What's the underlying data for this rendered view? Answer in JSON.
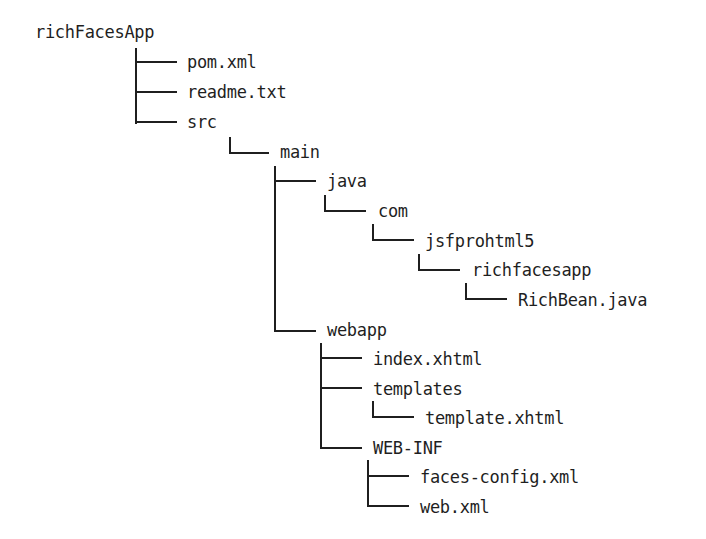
{
  "diagram": {
    "type": "directory-tree",
    "line_color": "#1f1f1f",
    "text_color": "#1f1f1f",
    "background": "#ffffff",
    "nodes": [
      {
        "id": "root",
        "label": "richFacesApp",
        "depth": 0,
        "kind": "folder"
      },
      {
        "id": "pom",
        "label": "pom.xml",
        "depth": 1,
        "kind": "file",
        "parent": "root"
      },
      {
        "id": "readme",
        "label": "readme.txt",
        "depth": 1,
        "kind": "file",
        "parent": "root"
      },
      {
        "id": "src",
        "label": "src",
        "depth": 1,
        "kind": "folder",
        "parent": "root"
      },
      {
        "id": "main",
        "label": "main",
        "depth": 2,
        "kind": "folder",
        "parent": "src"
      },
      {
        "id": "java",
        "label": "java",
        "depth": 3,
        "kind": "folder",
        "parent": "main"
      },
      {
        "id": "com",
        "label": "com",
        "depth": 4,
        "kind": "folder",
        "parent": "java"
      },
      {
        "id": "jsfprohtml5",
        "label": "jsfprohtml5",
        "depth": 5,
        "kind": "folder",
        "parent": "com"
      },
      {
        "id": "richfacesapp",
        "label": "richfacesapp",
        "depth": 6,
        "kind": "folder",
        "parent": "jsfprohtml5"
      },
      {
        "id": "richbean",
        "label": "RichBean.java",
        "depth": 7,
        "kind": "file",
        "parent": "richfacesapp"
      },
      {
        "id": "webapp",
        "label": "webapp",
        "depth": 3,
        "kind": "folder",
        "parent": "main"
      },
      {
        "id": "index",
        "label": "index.xhtml",
        "depth": 4,
        "kind": "file",
        "parent": "webapp"
      },
      {
        "id": "templates",
        "label": "templates",
        "depth": 4,
        "kind": "folder",
        "parent": "webapp"
      },
      {
        "id": "template",
        "label": "template.xhtml",
        "depth": 5,
        "kind": "file",
        "parent": "templates"
      },
      {
        "id": "webinf",
        "label": "WEB-INF",
        "depth": 4,
        "kind": "folder",
        "parent": "webapp"
      },
      {
        "id": "facesconfig",
        "label": "faces-config.xml",
        "depth": 5,
        "kind": "file",
        "parent": "webinf"
      },
      {
        "id": "webxml",
        "label": "web.xml",
        "depth": 5,
        "kind": "file",
        "parent": "webinf"
      }
    ]
  }
}
